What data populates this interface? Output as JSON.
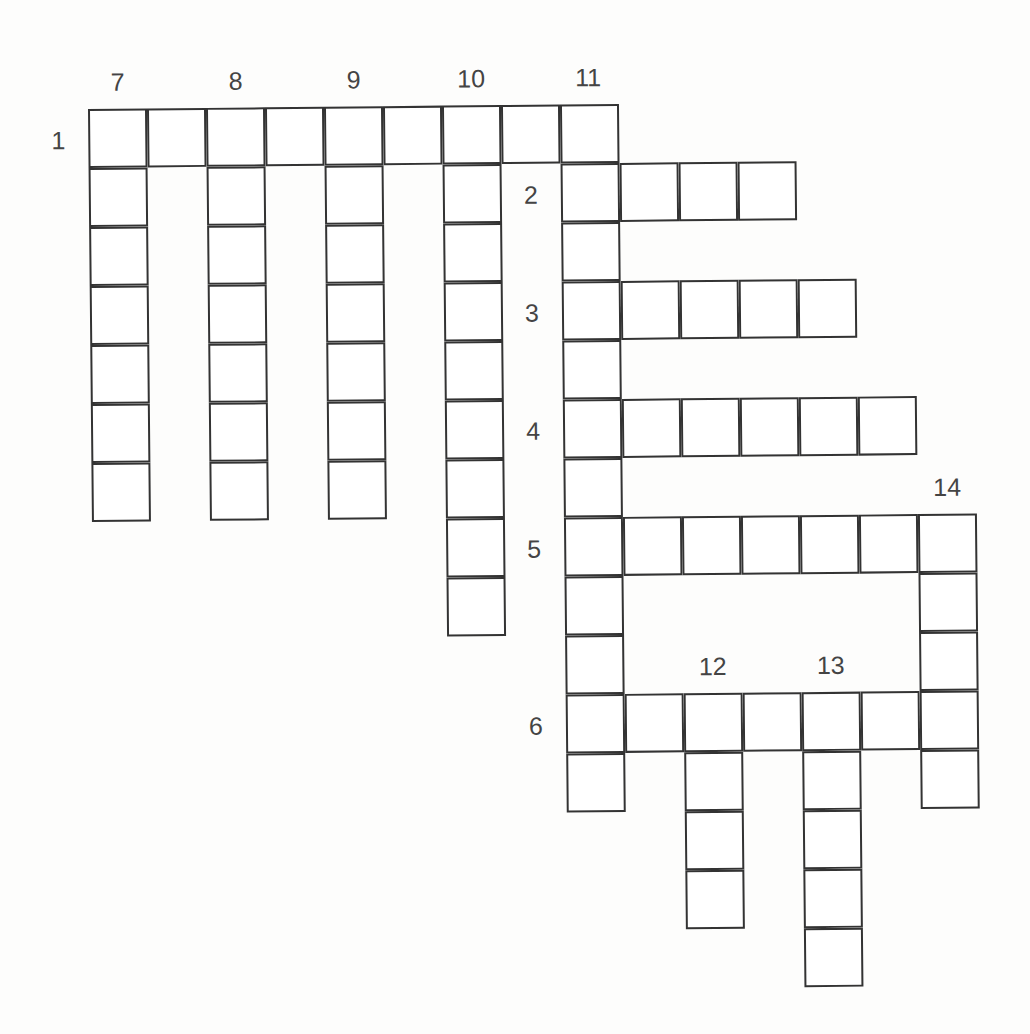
{
  "puzzle": {
    "cell_size": 59,
    "across": [
      {
        "number": "1",
        "row": 0,
        "col": 0,
        "length": 9
      },
      {
        "number": "2",
        "row": 1,
        "col": 8,
        "length": 4
      },
      {
        "number": "3",
        "row": 3,
        "col": 8,
        "length": 5
      },
      {
        "number": "4",
        "row": 5,
        "col": 8,
        "length": 6
      },
      {
        "number": "5",
        "row": 7,
        "col": 8,
        "length": 7
      },
      {
        "number": "6",
        "row": 10,
        "col": 8,
        "length": 7
      }
    ],
    "down": [
      {
        "number": "7",
        "row": 0,
        "col": 0,
        "length": 7
      },
      {
        "number": "8",
        "row": 0,
        "col": 2,
        "length": 7
      },
      {
        "number": "9",
        "row": 0,
        "col": 4,
        "length": 7
      },
      {
        "number": "10",
        "row": 0,
        "col": 6,
        "length": 9
      },
      {
        "number": "11",
        "row": 0,
        "col": 8,
        "length": 12
      },
      {
        "number": "12",
        "row": 10,
        "col": 10,
        "length": 4
      },
      {
        "number": "13",
        "row": 10,
        "col": 12,
        "length": 5
      },
      {
        "number": "14",
        "row": 7,
        "col": 14,
        "length": 5
      }
    ]
  }
}
